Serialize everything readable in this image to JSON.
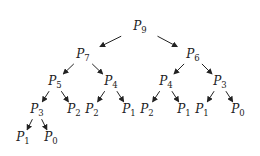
{
  "diagram": {
    "title": "",
    "arrow_color": "#222222",
    "nodes": [
      {
        "id": "n9",
        "label": "P",
        "sub": "9",
        "x": 140,
        "y": 27
      },
      {
        "id": "n7",
        "label": "P",
        "sub": "7",
        "x": 83,
        "y": 55
      },
      {
        "id": "n6",
        "label": "P",
        "sub": "6",
        "x": 193,
        "y": 55
      },
      {
        "id": "n5",
        "label": "P",
        "sub": "5",
        "x": 55,
        "y": 82
      },
      {
        "id": "n4a",
        "label": "P",
        "sub": "4",
        "x": 111,
        "y": 82
      },
      {
        "id": "n4b",
        "label": "P",
        "sub": "4",
        "x": 166,
        "y": 82
      },
      {
        "id": "n3b",
        "label": "P",
        "sub": "3",
        "x": 220,
        "y": 82
      },
      {
        "id": "n3a",
        "label": "P",
        "sub": "3",
        "x": 37,
        "y": 110
      },
      {
        "id": "n2a",
        "label": "P",
        "sub": "2",
        "x": 74,
        "y": 110
      },
      {
        "id": "n2b",
        "label": "P",
        "sub": "2",
        "x": 92,
        "y": 110
      },
      {
        "id": "n1a",
        "label": "P",
        "sub": "1",
        "x": 129,
        "y": 110
      },
      {
        "id": "n2c",
        "label": "P",
        "sub": "2",
        "x": 147,
        "y": 110
      },
      {
        "id": "n1b",
        "label": "P",
        "sub": "1",
        "x": 184,
        "y": 110
      },
      {
        "id": "n1c",
        "label": "P",
        "sub": "1",
        "x": 202,
        "y": 110
      },
      {
        "id": "n0a",
        "label": "P",
        "sub": "0",
        "x": 238,
        "y": 110
      },
      {
        "id": "n1d",
        "label": "P",
        "sub": "1",
        "x": 23,
        "y": 138
      },
      {
        "id": "n0b",
        "label": "P",
        "sub": "0",
        "x": 51,
        "y": 138
      }
    ],
    "edges": [
      {
        "from": "n9",
        "to": "n7"
      },
      {
        "from": "n9",
        "to": "n6"
      },
      {
        "from": "n7",
        "to": "n5"
      },
      {
        "from": "n7",
        "to": "n4a"
      },
      {
        "from": "n6",
        "to": "n4b"
      },
      {
        "from": "n6",
        "to": "n3b"
      },
      {
        "from": "n5",
        "to": "n3a"
      },
      {
        "from": "n5",
        "to": "n2a"
      },
      {
        "from": "n4a",
        "to": "n2b"
      },
      {
        "from": "n4a",
        "to": "n1a"
      },
      {
        "from": "n4b",
        "to": "n2c"
      },
      {
        "from": "n4b",
        "to": "n1b"
      },
      {
        "from": "n3b",
        "to": "n1c"
      },
      {
        "from": "n3b",
        "to": "n0a"
      },
      {
        "from": "n3a",
        "to": "n1d"
      },
      {
        "from": "n3a",
        "to": "n0b"
      }
    ]
  }
}
